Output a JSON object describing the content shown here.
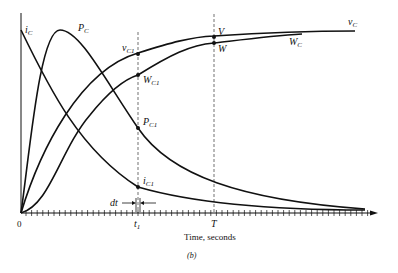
{
  "figure": {
    "caption": "(b)",
    "x_axis_label": "Time, seconds",
    "origin_label": "0",
    "t1_label": "t",
    "t1_sub": "1",
    "T_label": "T",
    "dt_label": "dt"
  },
  "curves": {
    "iC": {
      "label": "i",
      "sub": "C"
    },
    "PC": {
      "label": "P",
      "sub": "C"
    },
    "vC": {
      "label": "v",
      "sub": "C"
    },
    "WC": {
      "label": "W",
      "sub": "C"
    }
  },
  "points": {
    "vC1": {
      "label": "v",
      "sub": "C1"
    },
    "WC1": {
      "label": "W",
      "sub": "C1"
    },
    "PC1": {
      "label": "P",
      "sub": "C1"
    },
    "iC1": {
      "label": "i",
      "sub": "C1"
    },
    "V": {
      "label": "V"
    },
    "W": {
      "label": "W"
    }
  },
  "colors": {
    "ink": "#111111",
    "background": "#ffffff"
  }
}
